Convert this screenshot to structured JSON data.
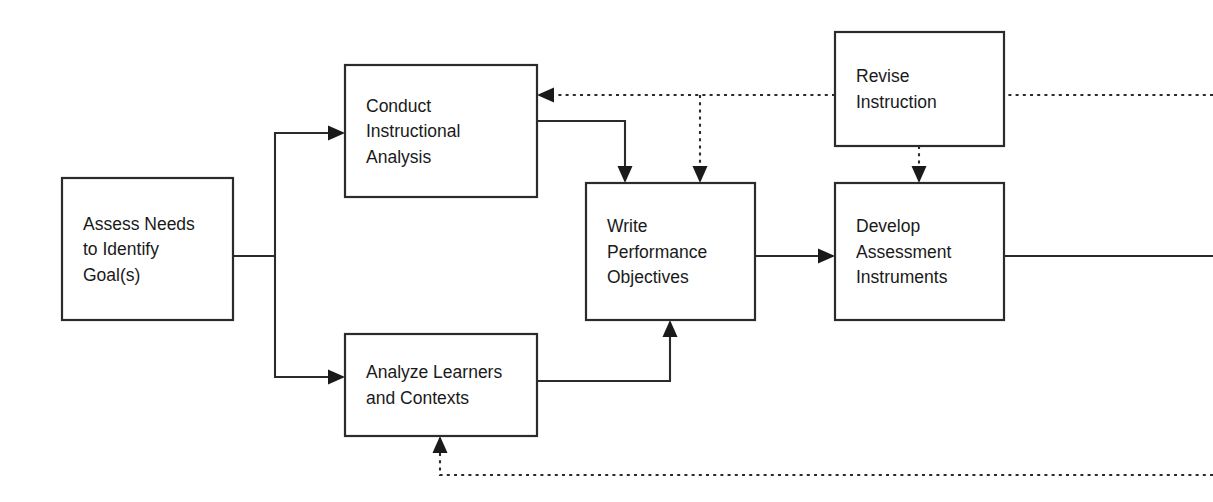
{
  "diagram": {
    "type": "flowchart",
    "canvas": {
      "width": 1213,
      "height": 502
    },
    "colors": {
      "background": "#ffffff",
      "box_fill": "#ffffff",
      "box_stroke": "#2b2b2b",
      "text": "#1a1a1a",
      "connector": "#2b2b2b"
    },
    "nodes": [
      {
        "id": "assess-needs",
        "label": "Assess Needs to Identify Goal(s)",
        "lines": [
          "Assess Needs",
          "to Identify",
          "Goal(s)"
        ],
        "x": 62,
        "y": 178,
        "w": 171,
        "h": 142
      },
      {
        "id": "conduct-instructional-analysis",
        "label": "Conduct Instructional Analysis",
        "lines": [
          "Conduct",
          "Instructional",
          "Analysis"
        ],
        "x": 345,
        "y": 65,
        "w": 192,
        "h": 132
      },
      {
        "id": "analyze-learners-and-contexts",
        "label": "Analyze Learners and Contexts",
        "lines": [
          "Analyze Learners",
          "and Contexts"
        ],
        "x": 345,
        "y": 334,
        "w": 192,
        "h": 102
      },
      {
        "id": "write-performance-objectives",
        "label": "Write Performance Objectives",
        "lines": [
          "Write",
          "Performance",
          "Objectives"
        ],
        "x": 586,
        "y": 183,
        "w": 169,
        "h": 137
      },
      {
        "id": "revise-instruction",
        "label": "Revise Instruction",
        "lines": [
          "Revise",
          "Instruction"
        ],
        "x": 835,
        "y": 32,
        "w": 169,
        "h": 114
      },
      {
        "id": "develop-assessment-instruments",
        "label": "Develop Assessment Instruments",
        "lines": [
          "Develop",
          "Assessment",
          "Instruments"
        ],
        "x": 835,
        "y": 183,
        "w": 169,
        "h": 137
      }
    ],
    "edges": [
      {
        "id": "assess-to-analysis",
        "from": "assess-needs",
        "to": "conduct-instructional-analysis",
        "style": "solid",
        "arrow": "end",
        "path": "M 233 256 L 275 256 L 275 133 L 333 133"
      },
      {
        "id": "assess-to-learners",
        "from": "assess-needs",
        "to": "analyze-learners-and-contexts",
        "style": "solid",
        "arrow": "end",
        "path": "M 275 256 L 275 377 L 333 377"
      },
      {
        "id": "analysis-to-objectives",
        "from": "conduct-instructional-analysis",
        "to": "write-performance-objectives",
        "style": "solid",
        "arrow": "end",
        "path": "M 537 121 L 625 121 L 625 171"
      },
      {
        "id": "learners-to-objectives",
        "from": "analyze-learners-and-contexts",
        "to": "write-performance-objectives",
        "style": "solid",
        "arrow": "end",
        "path": "M 537 381 L 670 381 L 670 332"
      },
      {
        "id": "objectives-to-assessment",
        "from": "write-performance-objectives",
        "to": "develop-assessment-instruments",
        "style": "solid",
        "arrow": "end",
        "path": "M 755 256 L 823 256"
      },
      {
        "id": "assessment-output-right",
        "from": "develop-assessment-instruments",
        "to": "off-canvas-right",
        "style": "solid",
        "arrow": "none",
        "path": "M 1004 256 L 1213 256"
      },
      {
        "id": "revise-feedback-to-analysis",
        "from": "revise-instruction",
        "to": "conduct-instructional-analysis",
        "style": "dashed",
        "arrow": "end",
        "path": "M 835 95 L 557 95"
      },
      {
        "id": "revise-feedback-to-objectives",
        "from": "revise-instruction",
        "to": "write-performance-objectives",
        "style": "dashed",
        "arrow": "end",
        "path": "M 700 95 L 700 171"
      },
      {
        "id": "revise-input-from-right",
        "from": "off-canvas-right",
        "to": "revise-instruction",
        "style": "dashed",
        "arrow": "none",
        "path": "M 1213 95 L 1004 95"
      },
      {
        "id": "revise-to-assessment",
        "from": "revise-instruction",
        "to": "develop-assessment-instruments",
        "style": "dashed",
        "arrow": "end",
        "path": "M 919 146 L 919 171"
      },
      {
        "id": "bottom-feedback-to-learners",
        "from": "off-canvas-right",
        "to": "analyze-learners-and-contexts",
        "style": "dashed",
        "arrow": "end",
        "path": "M 1213 475 L 440 475 L 440 448"
      }
    ],
    "arrowheads": [
      {
        "id": "ah-assess-to-analysis",
        "x": 345,
        "y": 133,
        "dir": "right"
      },
      {
        "id": "ah-assess-to-learners",
        "x": 345,
        "y": 377,
        "dir": "right"
      },
      {
        "id": "ah-analysis-to-objectives",
        "x": 625,
        "y": 183,
        "dir": "down"
      },
      {
        "id": "ah-revise-to-objectives",
        "x": 700,
        "y": 183,
        "dir": "down"
      },
      {
        "id": "ah-learners-to-objectives",
        "x": 670,
        "y": 320,
        "dir": "up"
      },
      {
        "id": "ah-objectives-to-assessment",
        "x": 835,
        "y": 256,
        "dir": "right"
      },
      {
        "id": "ah-revise-to-analysis",
        "x": 537,
        "y": 95,
        "dir": "left"
      },
      {
        "id": "ah-revise-to-assessment",
        "x": 919,
        "y": 183,
        "dir": "down"
      },
      {
        "id": "ah-bottom-to-learners",
        "x": 440,
        "y": 436,
        "dir": "up"
      }
    ]
  }
}
